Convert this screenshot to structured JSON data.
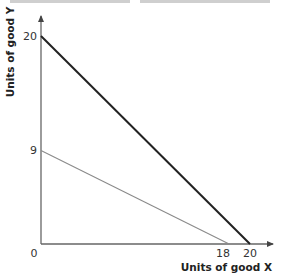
{
  "chart_data": {
    "type": "line",
    "title": "",
    "xlabel": "Units of good X",
    "ylabel": "Units of good Y",
    "xlim": [
      0,
      21
    ],
    "ylim": [
      0,
      22
    ],
    "grid": false,
    "legend": "none",
    "x_ticks": [
      {
        "value": 0,
        "label": "0"
      },
      {
        "value": 18,
        "label": "18"
      },
      {
        "value": 20,
        "label": "20"
      }
    ],
    "y_ticks": [
      {
        "value": 9,
        "label": "9"
      },
      {
        "value": 20,
        "label": "20"
      }
    ],
    "series": [
      {
        "name": "budget-line-20-20",
        "points": [
          [
            0,
            20
          ],
          [
            20,
            0
          ]
        ],
        "color": "#222222",
        "weight": "heavy"
      },
      {
        "name": "budget-line-9-18",
        "points": [
          [
            0,
            9
          ],
          [
            18,
            0
          ]
        ],
        "color": "#8a8a8a",
        "weight": "light"
      }
    ]
  },
  "colors": {
    "axis": "#555555",
    "text": "#333333"
  }
}
